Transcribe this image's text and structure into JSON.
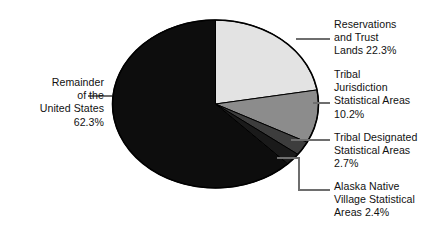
{
  "chart_data": {
    "type": "pie",
    "title": "",
    "subtitle": "",
    "xlabel": "",
    "ylabel": "",
    "legend_position": "callout-labels",
    "grid": false,
    "start_angle_deg": 0,
    "direction": "clockwise",
    "units": "percent",
    "total": 99.9,
    "categories": [
      "Reservations and Trust Lands",
      "Tribal Jurisdiction Statistical Areas",
      "Tribal Designated Statistical Areas",
      "Alaska Native Village Statistical Areas",
      "Remainder of the United States"
    ],
    "values": [
      22.3,
      10.2,
      2.7,
      2.4,
      62.3
    ],
    "colors": [
      "#e3e3e3",
      "#8c8c8c",
      "#3d3d3d",
      "#1a1a1a",
      "#0d0d0d"
    ],
    "slices": [
      {
        "name": "Reservations and Trust Lands",
        "value": 22.3,
        "value_text": "22.3%",
        "color": "#e3e3e3"
      },
      {
        "name": "Tribal Jurisdiction Statistical Areas",
        "value": 10.2,
        "value_text": "10.2%",
        "color": "#8c8c8c"
      },
      {
        "name": "Tribal Designated Statistical Areas",
        "value": 2.7,
        "value_text": "2.7%",
        "color": "#3d3d3d"
      },
      {
        "name": "Alaska Native Village Statistical Areas",
        "value": 2.4,
        "value_text": "2.4%",
        "color": "#1a1a1a"
      },
      {
        "name": "Remainder of the United States",
        "value": 62.3,
        "value_text": "62.3%",
        "color": "#0d0d0d"
      }
    ]
  },
  "labels": {
    "remainder": "Remainder\nof the\nUnited States\n62.3%",
    "reservations": "Reservations\nand Trust\nLands 22.3%",
    "tribal_jurisdiction": "Tribal\nJurisdiction\nStatistical Areas\n10.2%",
    "tribal_designated": "Tribal Designated\nStatistical Areas\n2.7%",
    "alaska_native": "Alaska Native\nVillage Statistical\nAreas 2.4%"
  },
  "style": {
    "background": "#ffffff",
    "text_color": "#111111",
    "outline_color": "#000000",
    "leader_color": "#6e6e6e"
  }
}
